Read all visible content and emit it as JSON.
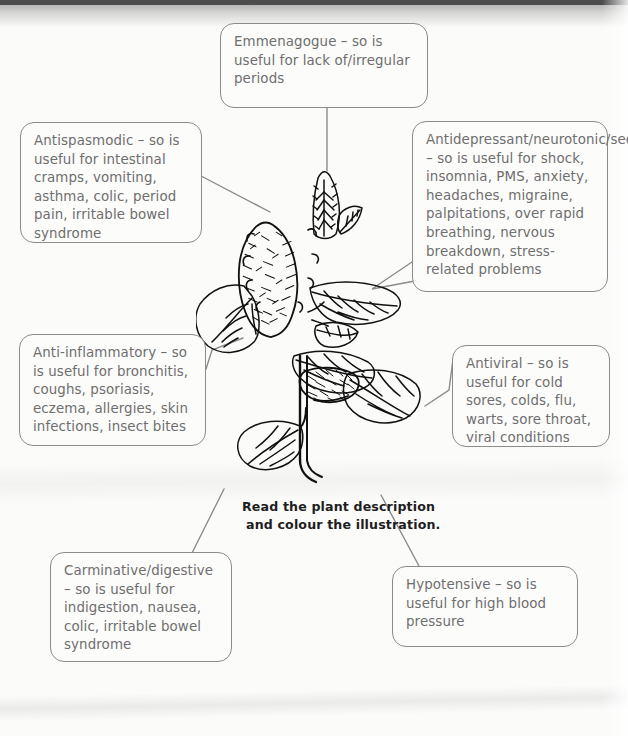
{
  "document": {
    "title": "Herbal plant properties worksheet",
    "illustration_name": "peppermint-plant-line-drawing"
  },
  "instruction": {
    "line1": "Read the plant description",
    "line2": "and colour the illustration."
  },
  "colors": {
    "background": "#fbfbfa",
    "box_border": "#8b8b8b",
    "box_text": "#6e6e6e",
    "instruction_text": "#1e1e1e",
    "line": "#8b8b8b",
    "plant_ink": "#111111"
  },
  "callouts": [
    {
      "id": "emmenagogue",
      "name": "callout-emmenagogue",
      "text": "Emmenagogue – so is useful for lack of/irregular periods"
    },
    {
      "id": "antispasmodic",
      "name": "callout-antispasmodic",
      "text": "Antispasmodic – so is useful for intestinal cramps, vomiting, asthma, colic, period pain, irritable bowel syndrome"
    },
    {
      "id": "antidepressant",
      "name": "callout-antidepressant",
      "text": "Antidepressant/neurotonic/sedative/calming – so is useful for shock, insomnia, PMS, anxiety, headaches, migraine, palpitations, over rapid breathing, nervous breakdown, stress-related problems"
    },
    {
      "id": "anti-inflammatory",
      "name": "callout-anti-inflammatory",
      "text": "Anti-inflammatory – so is useful for bronchitis, coughs, psoriasis, eczema, allergies, skin infections, insect bites"
    },
    {
      "id": "antiviral",
      "name": "callout-antiviral",
      "text": "Antiviral – so is useful for cold sores, colds, flu, warts, sore throat, viral conditions"
    },
    {
      "id": "carminative",
      "name": "callout-carminative-digestive",
      "text": "Carminative/digestive – so is useful for indigestion, nausea, colic, irritable bowel syndrome"
    },
    {
      "id": "hypotensive",
      "name": "callout-hypotensive",
      "text": "Hypotensive – so is useful for high blood pressure"
    }
  ]
}
